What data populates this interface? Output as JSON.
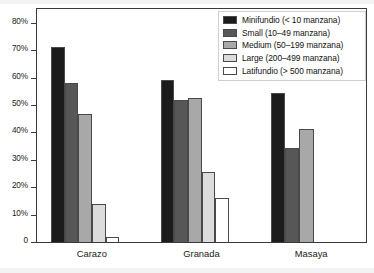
{
  "chart_data": {
    "type": "bar",
    "title": "",
    "xlabel": "",
    "ylabel": "",
    "categories": [
      "Carazo",
      "Granada",
      "Masaya"
    ],
    "ylim": [
      0,
      85
    ],
    "ytick_values": [
      0,
      10,
      20,
      30,
      40,
      50,
      60,
      70,
      80
    ],
    "ytick_labels": [
      "0",
      "10%",
      "20%",
      "30%",
      "40%",
      "50%",
      "60%",
      "70%",
      "80%"
    ],
    "grid": false,
    "legend_position": "top-right",
    "series": [
      {
        "name": "Minifundio (< 10 manzana)",
        "color": "#1c1c1c",
        "values": [
          71,
          59,
          54.5
        ]
      },
      {
        "name": "Small (10–49 manzana)",
        "color": "#575757",
        "values": [
          58,
          51.8,
          34.3
        ]
      },
      {
        "name": "Medium (50–199 manzana)",
        "color": "#a8a8a8",
        "values": [
          46.6,
          52.7,
          41.3
        ]
      },
      {
        "name": "Large (200–499 manzana)",
        "color": "#dcdcdc",
        "values": [
          13.8,
          25.5,
          0
        ]
      },
      {
        "name": "Latifundio (> 500 manzana)",
        "color": "#ffffff",
        "values": [
          1.8,
          16.2,
          0
        ]
      }
    ]
  },
  "legend": {
    "items": [
      {
        "label": "Minifundio (< 10 manzana)",
        "color": "#1c1c1c"
      },
      {
        "label": "Small (10–49 manzana)",
        "color": "#575757"
      },
      {
        "label": "Medium (50–199 manzana)",
        "color": "#a8a8a8"
      },
      {
        "label": "Large (200–499 manzana)",
        "color": "#dcdcdc"
      },
      {
        "label": "Latifundio (> 500 manzana)",
        "color": "#ffffff"
      }
    ]
  },
  "axes": {
    "y_ticks": [
      "80%",
      "70%",
      "60%",
      "50%",
      "40%",
      "30%",
      "20%",
      "10%",
      "0"
    ],
    "x_ticks": [
      "Carazo",
      "Granada",
      "Masaya"
    ]
  }
}
